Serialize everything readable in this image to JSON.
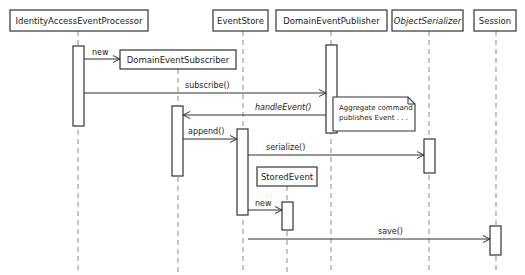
{
  "diagram": {
    "type": "uml-sequence",
    "width": 525,
    "height": 275,
    "colors": {
      "stroke": "#333333",
      "lifeline": "#8a8a8a",
      "text": "#222222",
      "background": "#ffffff"
    },
    "participants": [
      {
        "id": "iaep",
        "name": "IdentityAccessEventProcessor",
        "box": [
          10,
          10,
          138,
          21
        ],
        "lifeline_x": 78,
        "lifeline_y": [
          31,
          272
        ],
        "italic": false
      },
      {
        "id": "des",
        "name": "DomainEventSubscriber",
        "box": [
          120,
          50,
          116,
          19
        ],
        "lifeline_x": 178,
        "lifeline_y": [
          69,
          272
        ],
        "italic": false
      },
      {
        "id": "es",
        "name": "EventStore",
        "box": [
          213,
          10,
          55,
          21
        ],
        "lifeline_x": 243,
        "lifeline_y": [
          31,
          272
        ],
        "italic": false
      },
      {
        "id": "dep",
        "name": "DomainEventPublisher",
        "box": [
          276,
          10,
          111,
          21
        ],
        "lifeline_x": 331,
        "lifeline_y": [
          31,
          272
        ],
        "italic": false
      },
      {
        "id": "os",
        "name": "ObjectSerializer",
        "box": [
          392,
          10,
          71,
          21
        ],
        "lifeline_x": 429,
        "lifeline_y": [
          31,
          272
        ],
        "italic": true
      },
      {
        "id": "sess",
        "name": "Session",
        "box": [
          474,
          10,
          42,
          21
        ],
        "lifeline_x": 496,
        "lifeline_y": [
          31,
          272
        ],
        "italic": false
      },
      {
        "id": "se",
        "name": "StoredEvent",
        "box": [
          257,
          167,
          60,
          19
        ],
        "lifeline_x": 287,
        "lifeline_y": [
          186,
          272
        ],
        "italic": false
      }
    ],
    "activations": [
      {
        "of": "iaep",
        "x": 73,
        "y": 46,
        "w": 11,
        "h": 80
      },
      {
        "of": "iaep",
        "x": 73,
        "y": 126,
        "w": 11,
        "h": 0
      },
      {
        "of": "des",
        "x": 172,
        "y": 106,
        "w": 11,
        "h": 70
      },
      {
        "of": "es",
        "x": 237,
        "y": 129,
        "w": 11,
        "h": 86
      },
      {
        "of": "dep",
        "x": 326,
        "y": 45,
        "w": 11,
        "h": 88
      },
      {
        "of": "os",
        "x": 424,
        "y": 139,
        "w": 11,
        "h": 34
      },
      {
        "of": "se",
        "x": 282,
        "y": 202,
        "w": 11,
        "h": 28
      },
      {
        "of": "sess",
        "x": 490,
        "y": 226,
        "w": 11,
        "h": 29
      }
    ],
    "messages": [
      {
        "label": "new",
        "from_x": 84,
        "to_x": 120,
        "y": 59,
        "label_x": 92,
        "label_y": 55,
        "italic": false
      },
      {
        "label": "subscribe()",
        "from_x": 84,
        "to_x": 326,
        "y": 93,
        "label_x": 185,
        "label_y": 88,
        "italic": false
      },
      {
        "label": "handleEvent()",
        "from_x": 326,
        "to_x": 183,
        "y": 115,
        "label_x": 255,
        "label_y": 110,
        "italic": true
      },
      {
        "label": "append()",
        "from_x": 183,
        "to_x": 237,
        "y": 139,
        "label_x": 188,
        "label_y": 134,
        "italic": false
      },
      {
        "label": "serialize()",
        "from_x": 248,
        "to_x": 424,
        "y": 155,
        "label_x": 266,
        "label_y": 150,
        "italic": false
      },
      {
        "label": "new",
        "from_x": 248,
        "to_x": 282,
        "y": 210,
        "label_x": 255,
        "label_y": 206,
        "italic": false
      },
      {
        "label": "save()",
        "from_x": 248,
        "to_x": 490,
        "y": 239,
        "label_x": 378,
        "label_y": 234,
        "italic": false
      }
    ],
    "note": {
      "lines": [
        "Aggregate command",
        "publishes Event . . ."
      ],
      "x": 333,
      "y": 97,
      "w": 82,
      "h": 34,
      "fold": 7
    }
  }
}
